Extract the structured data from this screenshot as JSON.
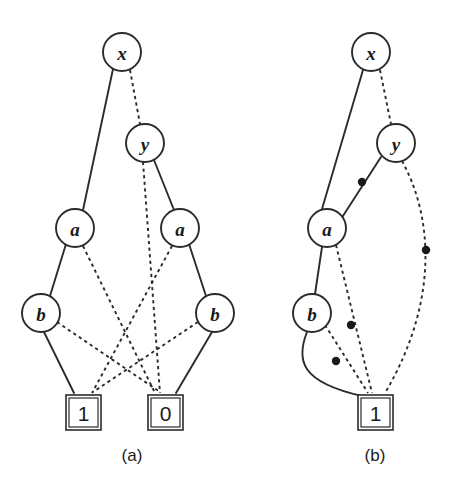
{
  "figure": {
    "background_color": "#ffffff",
    "ink_color": "#2b2b2b",
    "panels": [
      {
        "id": "panel-a",
        "caption": "(a)",
        "caption_x": 132,
        "caption_y": 455,
        "nodes": [
          {
            "id": "a-x",
            "label": "x",
            "shape": "circle",
            "cx": 122,
            "cy": 52,
            "r": 19
          },
          {
            "id": "a-y",
            "label": "y",
            "shape": "circle",
            "cx": 145,
            "cy": 143,
            "r": 19
          },
          {
            "id": "a-a1",
            "label": "a",
            "shape": "circle",
            "cx": 75,
            "cy": 228,
            "r": 19
          },
          {
            "id": "a-a2",
            "label": "a",
            "shape": "circle",
            "cx": 180,
            "cy": 228,
            "r": 19
          },
          {
            "id": "a-b1",
            "label": "b",
            "shape": "circle",
            "cx": 41,
            "cy": 313,
            "r": 19
          },
          {
            "id": "a-b2",
            "label": "b",
            "shape": "circle",
            "cx": 215,
            "cy": 313,
            "r": 19
          }
        ],
        "terminals": [
          {
            "id": "a-t1",
            "label": "1",
            "shape": "square",
            "x": 66,
            "y": 395,
            "w": 35,
            "h": 35
          },
          {
            "id": "a-t0",
            "label": "0",
            "shape": "square",
            "x": 148,
            "y": 395,
            "w": 35,
            "h": 35
          }
        ],
        "edges": [
          {
            "id": "a-e1",
            "from": "a-x",
            "to": "a-a1",
            "style": "solid",
            "path": "M 113 69 L 83 210"
          },
          {
            "id": "a-e2",
            "from": "a-x",
            "to": "a-y",
            "style": "dashed",
            "path": "M 130 70 L 140 124"
          },
          {
            "id": "a-e3",
            "from": "a-y",
            "to": "a-a2",
            "style": "solid",
            "path": "M 154 160 L 174 210"
          },
          {
            "id": "a-e4",
            "from": "a-y",
            "to": "a-t0",
            "style": "dashed",
            "path": "M 143 162 L 160 393"
          },
          {
            "id": "a-e5",
            "from": "a-a1",
            "to": "a-b1",
            "style": "solid",
            "path": "M 66 244 L 50 296"
          },
          {
            "id": "a-e6",
            "from": "a-a1",
            "to": "a-t0",
            "style": "dashed",
            "path": "M 83 246 L 155 393"
          },
          {
            "id": "a-e7",
            "from": "a-a2",
            "to": "a-b2",
            "style": "solid",
            "path": "M 189 244 L 206 296"
          },
          {
            "id": "a-e8",
            "from": "a-a2",
            "to": "a-t1",
            "style": "dashed",
            "path": "M 172 246 L 92 393"
          },
          {
            "id": "a-e9",
            "from": "a-b1",
            "to": "a-t1",
            "style": "solid",
            "path": "M 44 332 L 74 393"
          },
          {
            "id": "a-e10",
            "from": "a-b1",
            "to": "a-t0",
            "style": "dashed",
            "path": "M 57 322 L 160 392"
          },
          {
            "id": "a-e11",
            "from": "a-b2",
            "to": "a-t0",
            "style": "solid",
            "path": "M 212 332 L 176 393"
          },
          {
            "id": "a-e12",
            "from": "a-b2",
            "to": "a-t1",
            "style": "dashed",
            "path": "M 198 322 L 93 392"
          }
        ],
        "edge_dots": []
      },
      {
        "id": "panel-b",
        "caption": "(b)",
        "caption_x": 375,
        "caption_y": 455,
        "nodes": [
          {
            "id": "b-x",
            "label": "x",
            "shape": "circle",
            "cx": 371,
            "cy": 52,
            "r": 19
          },
          {
            "id": "b-y",
            "label": "y",
            "shape": "circle",
            "cx": 396,
            "cy": 143,
            "r": 19
          },
          {
            "id": "b-a",
            "label": "a",
            "shape": "circle",
            "cx": 327,
            "cy": 228,
            "r": 19
          },
          {
            "id": "b-b",
            "label": "b",
            "shape": "circle",
            "cx": 312,
            "cy": 313,
            "r": 19
          }
        ],
        "terminals": [
          {
            "id": "b-t1",
            "label": "1",
            "shape": "square",
            "x": 358,
            "y": 395,
            "w": 35,
            "h": 35
          }
        ],
        "edges": [
          {
            "id": "b-e1",
            "from": "b-x",
            "to": "b-a",
            "style": "solid",
            "path": "M 363 70 L 322 209"
          },
          {
            "id": "b-e2",
            "from": "b-x",
            "to": "b-y",
            "style": "dashed",
            "path": "M 380 70 L 391 124"
          },
          {
            "id": "b-e3",
            "from": "b-y",
            "to": "b-a",
            "style": "solid",
            "path": "M 381 157 L 341 219"
          },
          {
            "id": "b-e4",
            "from": "b-y",
            "to": "b-t1",
            "style": "dashed",
            "path": "M 402 161 C 432 215 440 300 385 393"
          },
          {
            "id": "b-e5",
            "from": "b-a",
            "to": "b-b",
            "style": "solid",
            "path": "M 322 247 L 315 294"
          },
          {
            "id": "b-e6",
            "from": "b-a",
            "to": "b-t1",
            "style": "dashed",
            "path": "M 336 245 L 372 393"
          },
          {
            "id": "b-e7",
            "from": "b-b",
            "to": "b-t1",
            "style": "solid",
            "path": "M 307 332 C 296 360 300 382 362 396"
          },
          {
            "id": "b-e8",
            "from": "b-b",
            "to": "b-t1",
            "style": "dashed",
            "path": "M 325 325 L 368 393"
          }
        ],
        "edge_dots": [
          {
            "id": "b-dot-ya",
            "on_edge": "b-e3",
            "cx": 362,
            "cy": 182,
            "r": 4.2
          },
          {
            "id": "b-dot-y1",
            "on_edge": "b-e4",
            "cx": 426,
            "cy": 250,
            "r": 4.2
          },
          {
            "id": "b-dot-a1",
            "on_edge": "b-e6",
            "cx": 351,
            "cy": 325,
            "r": 4.2
          },
          {
            "id": "b-dot-b1",
            "on_edge": "b-e8",
            "cx": 336,
            "cy": 361,
            "r": 4.2
          }
        ]
      }
    ]
  }
}
